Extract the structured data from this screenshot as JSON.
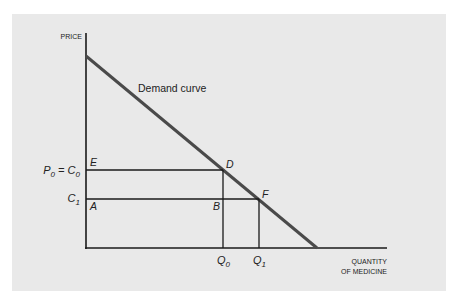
{
  "diagram": {
    "type": "economics-demand-diagram",
    "y_axis_label": "PRICE",
    "x_axis_label_line1": "QUANTITY",
    "x_axis_label_line2": "OF MEDICINE",
    "curve_label": "Demand curve",
    "price_labels": {
      "p0": {
        "main": "P",
        "sub": "0",
        "eq": " = C",
        "sub2": "0"
      },
      "c1": {
        "main": "C",
        "sub": "1"
      }
    },
    "quantity_labels": {
      "q0": {
        "main": "Q",
        "sub": "0"
      },
      "q1": {
        "main": "Q",
        "sub": "1"
      }
    },
    "points": {
      "E": "E",
      "D": "D",
      "A": "A",
      "B": "B",
      "F": "F"
    },
    "colors": {
      "panel": "#e9e9e9",
      "curve": "#4a4a4a",
      "axis": "#1a1a1a"
    }
  }
}
